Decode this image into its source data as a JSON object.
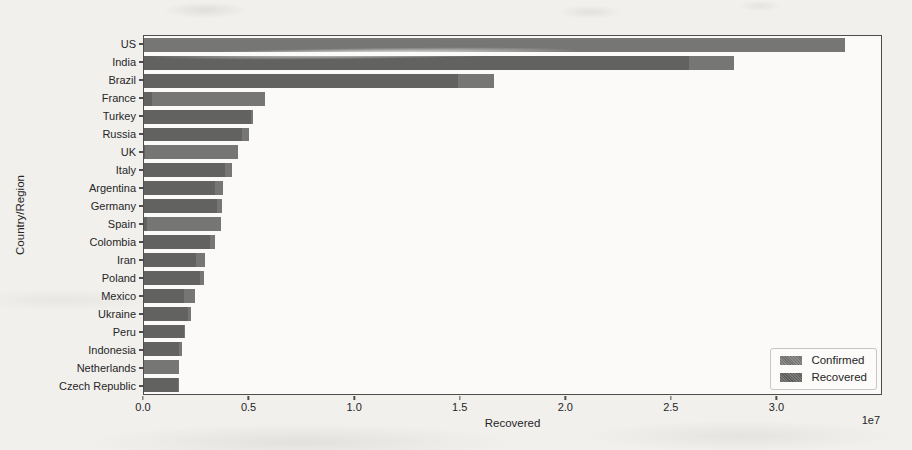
{
  "figure": {
    "title": "",
    "xlabel": "Recovered",
    "ylabel": "Country/Region",
    "offset_text": "1e7",
    "xticks": [
      "0.0",
      "0.5",
      "1.0",
      "1.5",
      "2.0",
      "2.5",
      "3.0"
    ],
    "legend": [
      {
        "label": "Confirmed",
        "color": "#767675"
      },
      {
        "label": "Recovered",
        "color": "#626261"
      }
    ]
  },
  "colors": {
    "confirmed_bar": "#767675",
    "recovered_bar": "#626261",
    "plot_background": "#fbfaf8",
    "page_background": "#f1f0ed",
    "spine": "#4d4d4d",
    "text": "#262626"
  },
  "chart_data": {
    "type": "bar",
    "orientation": "horizontal",
    "title": "",
    "xlabel": "Recovered",
    "ylabel": "Country/Region",
    "xlim": [
      0,
      35000000
    ],
    "axis_unit": "1e7",
    "grid": false,
    "legend_position": "lower right",
    "categories": [
      "US",
      "India",
      "Brazil",
      "France",
      "Turkey",
      "Russia",
      "UK",
      "Italy",
      "Argentina",
      "Germany",
      "Spain",
      "Colombia",
      "Iran",
      "Poland",
      "Mexico",
      "Ukraine",
      "Peru",
      "Indonesia",
      "Netherlands",
      "Czech Republic"
    ],
    "series": [
      {
        "name": "Confirmed",
        "values": [
          33300000,
          28000000,
          16600000,
          5750000,
          5200000,
          5000000,
          4450000,
          4200000,
          3740000,
          3700000,
          3680000,
          3360000,
          2900000,
          2870000,
          2400000,
          2240000,
          1950000,
          1820000,
          1660000,
          1660000
        ]
      },
      {
        "name": "Recovered",
        "values": [
          0,
          25900000,
          14900000,
          400000,
          5070000,
          4640000,
          16000,
          3850000,
          3360000,
          3480000,
          150000,
          3130000,
          2450000,
          2640000,
          1920000,
          2110000,
          1900000,
          1670000,
          0,
          1610000
        ]
      }
    ]
  }
}
